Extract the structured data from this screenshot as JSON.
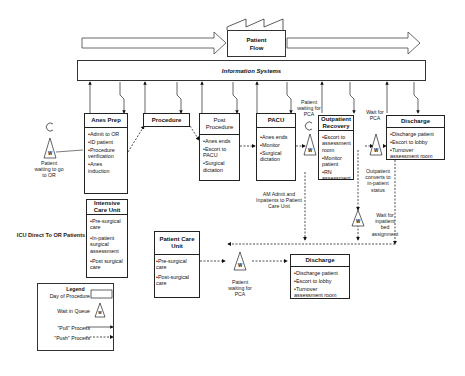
{
  "title": "Patient Flow",
  "info_bar": "Information Systems",
  "boxes": {
    "anes_prep": {
      "title": "Anes Prep",
      "items": [
        "Admit to OR",
        "ID patient",
        "Procedure verification",
        "Anes induction"
      ]
    },
    "procedure": {
      "title": "Procedure"
    },
    "post_procedure": {
      "title": "Post Procedure",
      "items": [
        "Anes ends",
        "Escort to PACU",
        "Surgical dictation"
      ]
    },
    "pacu": {
      "title": "PACU",
      "items": [
        "Anes ends",
        "Monitor",
        "Surgical dictation"
      ]
    },
    "outpatient_recovery": {
      "title": "Outpatient Recovery",
      "items": [
        "Escort to assessment room",
        "Monitor patient",
        "RN assessment"
      ]
    },
    "discharge_top": {
      "title": "Discharge",
      "items": [
        "Discharge patient",
        "Escort to lobby",
        "Turnover assessment room"
      ]
    },
    "icu": {
      "title": "Intensive Care Unit",
      "items": [
        "Pre-surgical care",
        "In-patient surgical assessment",
        "Post surgical care"
      ]
    },
    "patient_care_unit": {
      "title": "Patient Care Unit",
      "items": [
        "Pre-surgical care",
        "Post-surgical care"
      ]
    },
    "discharge_bottom": {
      "title": "Discharge",
      "items": [
        "Discharge patient",
        "Escort to lobby",
        "Turnover assessment room"
      ]
    }
  },
  "labels": {
    "patient_waiting_or": "Patient waiting to go to OR",
    "patient_waiting_pca_top": "Patient waiting for PCA",
    "wait_for_pca": "Wait for PCA",
    "outpatient_converts": "Outpatient converts to in-patient status",
    "wait_inpatient_bed": "Wait for inpatient bed assignment",
    "am_admit": "AM Admit and Inpatients to Patient Care Unit",
    "icu_direct": "ICU Direct To OR Patients",
    "patient_waiting_pca_bottom": "Patient waiting for PCA",
    "wait_glyph": "W"
  },
  "legend": {
    "title": "Legend",
    "day_of_procedure": "Day of Procedure",
    "wait_in_queue": "Wait in Queue",
    "pull_process": "\"Pull\" Process",
    "push_process": "\"Push\" Process"
  }
}
